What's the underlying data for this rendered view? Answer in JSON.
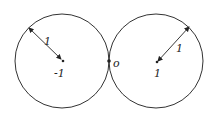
{
  "diagram": {
    "left_circle": {
      "center_label": "-1",
      "radius_label": "1"
    },
    "right_circle": {
      "center_label": "1",
      "radius_label": "1"
    },
    "tangent_label": "o",
    "stroke_color": "#333333"
  }
}
